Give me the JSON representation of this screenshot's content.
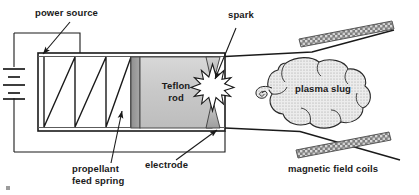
{
  "diagram": {
    "background_color": "#ffffff",
    "line_color": "#1a1a1a",
    "labels": {
      "power_source": "power source",
      "spark": "spark",
      "plasma_slug": "plasma slug",
      "teflon_rod_line1": "Teflon",
      "teflon_rod_line2": "rod",
      "propellant_line1": "propellant",
      "propellant_line2": "feed spring",
      "electrode": "electrode",
      "magnetic_field_coils": "magnetic field coils"
    },
    "components": {
      "battery": {
        "name": "power-source-battery",
        "icon": "battery-cell-icon",
        "plate_count": 4
      },
      "chamber": {
        "name": "thruster-chamber",
        "fill": "#ffffff",
        "stroke": "#1a1a1a"
      },
      "spring": {
        "name": "propellant-feed-spring",
        "icon": "zigzag-spring-icon",
        "zigzag_peaks": 3
      },
      "teflon_rod": {
        "name": "teflon-rod-block",
        "fill": "#c8c8c8",
        "edge_fill": "#9a9a9a",
        "stroke": "#333333"
      },
      "electrodes": {
        "name": "electrode-pair",
        "icon": "triangle-electrode-icon",
        "fill": "#b5b5b5",
        "count": 2
      },
      "spark": {
        "name": "spark-burst",
        "icon": "starburst-icon",
        "fill": "#ffffff"
      },
      "plasma_slug": {
        "name": "plasma-slug-cloud",
        "icon": "cloud-icon",
        "fill": "#e2e2e2"
      },
      "magnetic_coils": {
        "name": "magnetic-field-coil-bar",
        "icon": "hatched-bar-icon",
        "fill": "#8c8c8c",
        "count": 2
      }
    }
  }
}
